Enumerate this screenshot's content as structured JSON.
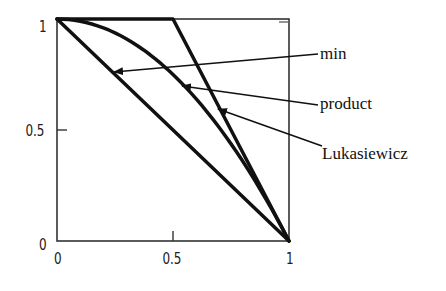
{
  "chart_data": {
    "type": "line",
    "title": "",
    "xlabel": "",
    "ylabel": "",
    "xlim": [
      0,
      1
    ],
    "ylim": [
      0,
      1
    ],
    "grid": false,
    "xticks": [
      "0",
      "0.5",
      "1"
    ],
    "yticks": [
      "0",
      "0.5",
      "1"
    ],
    "series": [
      {
        "name": "min",
        "x": [
          0,
          0.25,
          0.5,
          0.75,
          1
        ],
        "y": [
          1,
          0.75,
          0.5,
          0.25,
          0
        ]
      },
      {
        "name": "product",
        "x": [
          0,
          0.25,
          0.5,
          0.75,
          1
        ],
        "y": [
          1,
          0.94,
          0.75,
          0.44,
          0
        ]
      },
      {
        "name": "Lukasiewicz",
        "x": [
          0,
          0.5,
          0.75,
          1
        ],
        "y": [
          1,
          1,
          0.5,
          0
        ]
      }
    ],
    "annotations": [
      {
        "text": "min",
        "arrow_to": [
          0.25,
          0.77
        ]
      },
      {
        "text": "product",
        "arrow_to": [
          0.53,
          0.69
        ]
      },
      {
        "text": "Lukasiewicz",
        "arrow_to": [
          0.68,
          0.56
        ]
      }
    ]
  },
  "labels": {
    "x0": "0",
    "x05": "0.5",
    "x1": "1",
    "y0": "0",
    "y05": "0.5",
    "y1": "1",
    "min": "min",
    "product": "product",
    "lukasiewicz": "Lukasiewicz"
  }
}
